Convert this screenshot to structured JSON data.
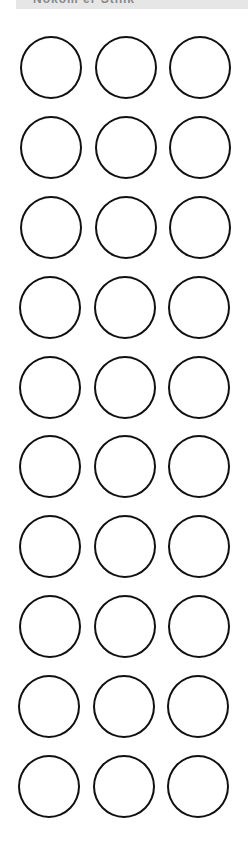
{
  "header": {
    "title": "Nokom er Stink"
  },
  "grid": {
    "rows": 10,
    "columns": 3,
    "first_row_top": 36,
    "row_pitch": 80,
    "column_lefts": [
      20,
      95,
      169
    ],
    "stroke_color": "#111111",
    "fill_color": "#ffffff"
  }
}
